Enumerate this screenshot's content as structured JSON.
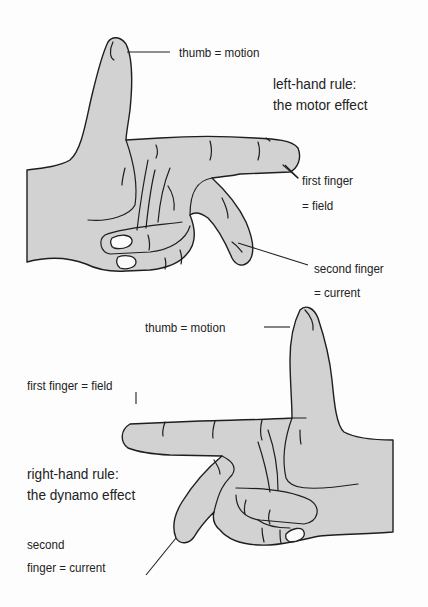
{
  "diagram": {
    "type": "labeled-illustration",
    "colors": {
      "hand_fill": "#d2d2d2",
      "outline": "#1e1e1e",
      "background": "#fdfdfd",
      "nail": "#fbfbfb"
    }
  },
  "left_hand": {
    "title_line1": "left-hand rule:",
    "title_line2": "the motor effect",
    "thumb_label": "thumb = motion",
    "first_finger_label_line1": "first finger",
    "first_finger_label_line2": "= field",
    "second_finger_label_line1": "second finger",
    "second_finger_label_line2": "= current"
  },
  "right_hand": {
    "title_line1": "right-hand rule:",
    "title_line2": "the dynamo effect",
    "thumb_label": "thumb = motion",
    "first_finger_label": "first finger = field",
    "second_finger_label_line1": "second",
    "second_finger_label_line2": "finger = current"
  }
}
